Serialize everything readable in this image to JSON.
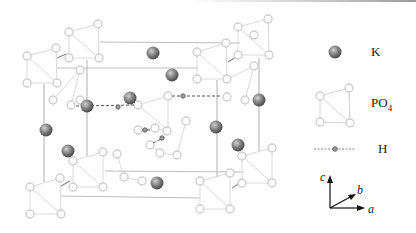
{
  "figure": {
    "colors": {
      "potassium_fill": "#7a7a7a",
      "potassium_highlight": "#c9c9c9",
      "oxygen_stroke": "#cfcfcf",
      "bond_stroke": "#d6d6d6",
      "cell_edge": "#b9b9b9",
      "hbond": "#555555",
      "hydrogen": "#8a8a8a"
    }
  },
  "legend": {
    "items": [
      {
        "symbol": "potassium-sphere",
        "label": "K"
      },
      {
        "symbol": "po4-tetrahedron",
        "label_main": "PO",
        "label_sub": "4"
      },
      {
        "symbol": "hydrogen-bond",
        "label": "H"
      }
    ],
    "axes": {
      "c": "c",
      "b": "b",
      "a": "a"
    }
  },
  "structure": {
    "potassium_atoms": [
      [
        153,
        53
      ],
      [
        172,
        75
      ],
      [
        130,
        98
      ],
      [
        87,
        106
      ],
      [
        259,
        100
      ],
      [
        46,
        130
      ],
      [
        216,
        127
      ],
      [
        68,
        151
      ],
      [
        238,
        145
      ],
      [
        157,
        183
      ]
    ],
    "hydrogen_bonds": [
      {
        "x1": 76,
        "y1": 106,
        "x2": 138,
        "y2": 105,
        "h": [
          118,
          107
        ]
      },
      {
        "x1": 172,
        "y1": 96,
        "x2": 222,
        "y2": 96,
        "h": [
          183,
          96
        ]
      },
      {
        "x1": 140,
        "y1": 130,
        "x2": 152,
        "y2": 130,
        "h": [
          145,
          130
        ]
      },
      {
        "x1": 150,
        "y1": 145,
        "x2": 166,
        "y2": 134,
        "h": [
          162,
          138
        ]
      }
    ]
  }
}
